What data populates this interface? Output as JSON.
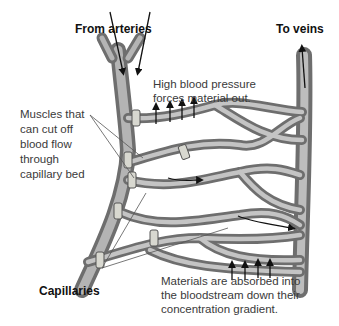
{
  "labels": {
    "from_arteries": "From arteries",
    "to_veins": "To veins",
    "high_pressure_line1": "High blood pressure",
    "high_pressure_line2": "forces material out.",
    "muscles_line1": "Muscles that",
    "muscles_line2": "can cut off",
    "muscles_line3": "blood flow",
    "muscles_line4": "through",
    "muscles_line5": "capillary bed",
    "capillaries": "Capillaries",
    "absorbed_line1": "Materials are absorbed into",
    "absorbed_line2": "the bloodstream down their",
    "absorbed_line3": "concentration gradient."
  },
  "colors": {
    "vessel_dark": "#6e6e6e",
    "vessel_mid": "#9a9a9a",
    "vessel_light": "#cfcfcf",
    "text": "#3a3a3a",
    "arrow": "#111111"
  }
}
